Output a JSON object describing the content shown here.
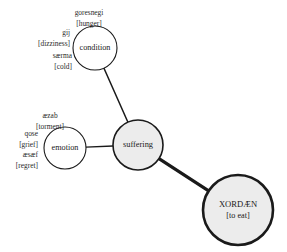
{
  "diagram": {
    "title": "",
    "background_color": "#ffffff",
    "node_fill_color": "#ececec",
    "node_stroke_color": "#1a1a1a",
    "edge_color": "#1a1a1a",
    "text_color": "#1a1a1a"
  },
  "nodes": [
    {
      "id": "condition",
      "label": "condition",
      "gloss": "",
      "cx": 95,
      "cy": 48,
      "r": 22,
      "stroke_width": 1.1,
      "fill": "#ffffff",
      "font_size": 8.2,
      "emphasis": "normal"
    },
    {
      "id": "emotion",
      "label": "emotion",
      "gloss": "",
      "cx": 65,
      "cy": 148,
      "r": 21,
      "stroke_width": 1.1,
      "fill": "#ffffff",
      "font_size": 8.2,
      "emphasis": "normal"
    },
    {
      "id": "suffering",
      "label": "suffering",
      "gloss": "",
      "cx": 138,
      "cy": 145,
      "r": 25,
      "stroke_width": 1.6,
      "fill": "#ececec",
      "font_size": 8.4,
      "emphasis": "medium"
    },
    {
      "id": "xordaen",
      "label": "XORDÆN",
      "gloss": "[to eat]",
      "cx": 238,
      "cy": 210,
      "r": 35,
      "stroke_width": 2.6,
      "fill": "#ececec",
      "font_size": 8.6,
      "emphasis": "strong"
    }
  ],
  "edges": [
    {
      "from": "condition",
      "to": "suffering",
      "stroke_width": 1.4
    },
    {
      "from": "emotion",
      "to": "suffering",
      "stroke_width": 1.4
    },
    {
      "from": "suffering",
      "to": "xordaen",
      "stroke_width": 3.2
    }
  ],
  "satellites": [
    {
      "id": "goresnegi",
      "attached_to": "condition",
      "term": "goresnegi",
      "gloss": "[hunger]",
      "term_x": 89,
      "term_y": 13,
      "gloss_x": 89,
      "gloss_y": 24,
      "align": "middle",
      "font_size": 7.4
    },
    {
      "id": "gij",
      "attached_to": "condition",
      "term": "gij",
      "gloss": "[dizziness]",
      "term_x": 70,
      "term_y": 33,
      "gloss_x": 70,
      "gloss_y": 44,
      "align": "end",
      "font_size": 7.4
    },
    {
      "id": "saerma",
      "attached_to": "condition",
      "term": "særma",
      "gloss": "[cold]",
      "term_x": 72,
      "term_y": 56,
      "gloss_x": 72,
      "gloss_y": 67,
      "align": "end",
      "font_size": 7.4
    },
    {
      "id": "aezab",
      "attached_to": "emotion",
      "term": "æzab",
      "gloss": "[torment]",
      "term_x": 50,
      "term_y": 116,
      "gloss_x": 50,
      "gloss_y": 127,
      "align": "middle",
      "font_size": 7.4
    },
    {
      "id": "qose",
      "attached_to": "emotion",
      "term": "qose",
      "gloss": "[grief]",
      "term_x": 38,
      "term_y": 134,
      "gloss_x": 38,
      "gloss_y": 145,
      "align": "end",
      "font_size": 7.4
    },
    {
      "id": "aesaef",
      "attached_to": "emotion",
      "term": "æsæf",
      "gloss": "[regret]",
      "term_x": 38,
      "term_y": 155,
      "gloss_x": 38,
      "gloss_y": 166,
      "align": "end",
      "font_size": 7.4
    }
  ]
}
